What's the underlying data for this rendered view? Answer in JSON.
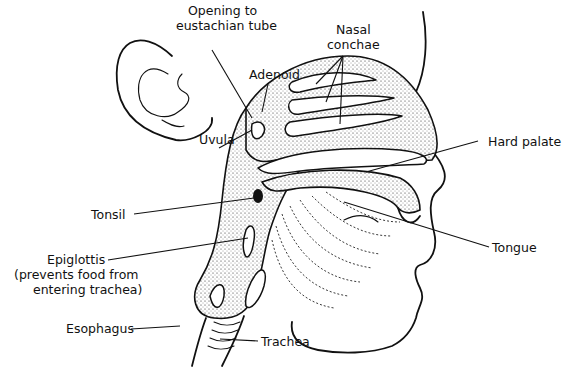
{
  "diagram": {
    "colors": {
      "ink": "#111111",
      "background": "#ffffff"
    },
    "labels": {
      "opening_eustachian_line1": "Opening to",
      "opening_eustachian_line2": "eustachian tube",
      "nasal_conchae_line1": "Nasal",
      "nasal_conchae_line2": "conchae",
      "adenoid": "Adenoid",
      "uvula": "Uvula",
      "hard_palate": "Hard palate",
      "tonsil": "Tonsil",
      "tongue": "Tongue",
      "epiglottis_line1": "Epiglottis",
      "epiglottis_line2": "(prevents food from",
      "epiglottis_line3": "entering trachea)",
      "esophagus": "Esophagus",
      "trachea": "Trachea"
    }
  }
}
